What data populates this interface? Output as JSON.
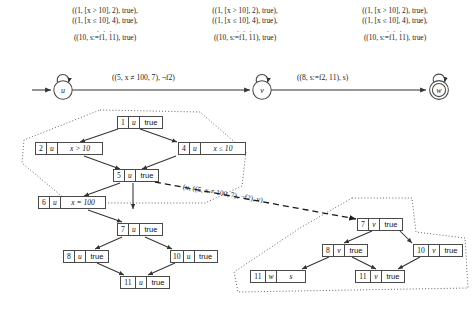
{
  "figure": {
    "transition_set_labels": [
      {
        "lines": [
          "((1, [x > 10], 2), true),",
          "((1, [x ≤ 10], 4), true),"
        ],
        "ellipsis": ". . .",
        "last_line": "((10, s:=f1, 11), true)"
      },
      {
        "lines": [
          "((1, [x > 10], 2), true),",
          "((1, [x ≤ 10], 4), true),"
        ],
        "ellipsis": ". . .",
        "last_line": "((10, s:=f1, 11), true)"
      },
      {
        "lines": [
          "((1, [x > 10], 2), true),",
          "((1, [x ≤ 10], 4), true),"
        ],
        "ellipsis": ". . .",
        "last_line": "((10, s:=f1, 11), true)"
      }
    ],
    "automaton": {
      "states": [
        {
          "name": "u",
          "accepting": false,
          "initial": true,
          "self_loop": true
        },
        {
          "name": "v",
          "accepting": false,
          "initial": false,
          "self_loop": true
        },
        {
          "name": "w",
          "accepting": true,
          "initial": false,
          "self_loop": true
        }
      ],
      "transitions": [
        {
          "from": "u",
          "to": "v",
          "label": "((5, x ≠ 100, 7), ¬f2)"
        },
        {
          "from": "v",
          "to": "w",
          "label": "((8, s:=f2, 11), s)"
        }
      ]
    },
    "left_tree": {
      "nodes": [
        {
          "id": "1",
          "state": "u",
          "cond": "true"
        },
        {
          "id": "2",
          "state": "u",
          "cond": "x > 10"
        },
        {
          "id": "4",
          "state": "u",
          "cond": "x ≤ 10"
        },
        {
          "id": "5",
          "state": "u",
          "cond": "true"
        },
        {
          "id": "6",
          "state": "u",
          "cond": "x = 100"
        },
        {
          "id": "7",
          "state": "u",
          "cond": "true"
        },
        {
          "id": "8",
          "state": "u",
          "cond": "true"
        },
        {
          "id": "10",
          "state": "u",
          "cond": "true"
        },
        {
          "id": "11",
          "state": "u",
          "cond": "true"
        }
      ]
    },
    "right_tree": {
      "nodes": [
        {
          "id": "7",
          "state": "v",
          "cond": "true"
        },
        {
          "id": "8",
          "state": "v",
          "cond": "true"
        },
        {
          "id": "10",
          "state": "v",
          "cond": "true"
        },
        {
          "id": "11",
          "state": "w",
          "cond": "s"
        },
        {
          "id": "11",
          "state": "v",
          "cond": "true"
        }
      ]
    },
    "dashed_edge_label": "(u, ((5, x ≠ 100, 7), ¬f2), v)",
    "colors": {
      "stroke": "#4a4a4a",
      "text": "#1a1a1a",
      "arrow": "#333333",
      "dotted_region": "#555555",
      "background": "#ffffff"
    }
  }
}
